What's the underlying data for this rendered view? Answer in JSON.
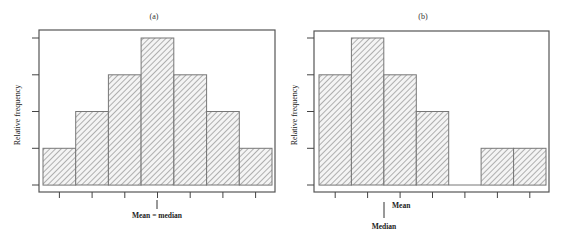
{
  "chart_data": [
    {
      "type": "bar",
      "title": "(a)",
      "xlabel": "",
      "ylabel": "Relative frequency",
      "categories": [
        "1",
        "2",
        "3",
        "4",
        "5",
        "6",
        "7"
      ],
      "values": [
        1,
        2,
        3,
        4,
        3,
        2,
        1
      ],
      "ylim": [
        0,
        4
      ],
      "y_ticks": 5,
      "x_ticks": 7,
      "tick_labels_shown": false,
      "grid": false,
      "fill_pattern": "diagonal-hatch",
      "annotations": [
        {
          "text": "Mean = median",
          "position_bin": 4,
          "marker": "vertical-line"
        }
      ],
      "shape": "symmetric"
    },
    {
      "type": "bar",
      "title": "(b)",
      "xlabel": "",
      "ylabel": "Relative frequency",
      "categories": [
        "1",
        "2",
        "3",
        "4",
        "5",
        "6",
        "7"
      ],
      "values": [
        3,
        4,
        3,
        2,
        0,
        1,
        1
      ],
      "ylim": [
        0,
        4
      ],
      "y_ticks": 5,
      "x_ticks": 7,
      "tick_labels_shown": false,
      "grid": false,
      "fill_pattern": "diagonal-hatch",
      "annotations": [
        {
          "text": "Mean",
          "position_bin": 3,
          "marker": "label-right"
        },
        {
          "text": "Median",
          "position_bin": 2.5,
          "marker": "vertical-line"
        }
      ],
      "shape": "right-skewed"
    }
  ],
  "colors": {
    "frame": "#555555",
    "hatch": "#8a8a8a",
    "bar_fill": "#f4f4f4",
    "text": "#222222"
  }
}
